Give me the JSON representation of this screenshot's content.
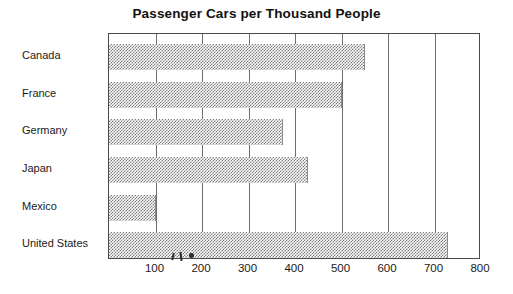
{
  "chart_data": {
    "type": "bar",
    "orientation": "horizontal",
    "title": "Passenger Cars per Thousand People",
    "xlabel": "",
    "ylabel": "",
    "categories": [
      "Canada",
      "France",
      "Germany",
      "Japan",
      "Mexico",
      "United States"
    ],
    "values": [
      550,
      500,
      375,
      427,
      100,
      728
    ],
    "xlim": [
      0,
      800
    ],
    "xticks": [
      100,
      200,
      300,
      400,
      500,
      600,
      700,
      800
    ],
    "xtick_labels": [
      "100",
      "200",
      "300",
      "400",
      "500",
      "600",
      "700",
      "800"
    ],
    "grid": true,
    "grid_axis": "x",
    "legend": false,
    "bar_fill": "#7d7d7d",
    "bar_pattern": "50-percent-dither",
    "frame_color": "#4a4a4a",
    "background": "#ffffff",
    "series": [
      {
        "name": "Passenger cars per thousand people",
        "values": [
          550,
          500,
          375,
          427,
          100,
          728
        ]
      }
    ]
  }
}
